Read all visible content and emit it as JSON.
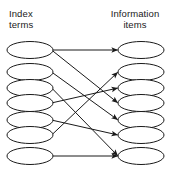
{
  "diagram": {
    "type": "bipartite-graph",
    "title_left": "Index\nterms",
    "title_right": "Information\nitems",
    "left_label_line1": "Index",
    "left_label_line2": "terms",
    "right_label_line1": "Information",
    "right_label_line2": "items",
    "colors": {
      "node_stroke": "#1a1a1a",
      "node_fill": "#ffffff",
      "edge": "#1a1a1a",
      "text": "#1a1a1a",
      "background": "#ffffff"
    },
    "geometry": {
      "left_cx": 30,
      "right_cx": 141,
      "rx": 23,
      "ry": 8.5
    },
    "left_nodes": [
      {
        "id": "L1",
        "cy": 50
      },
      {
        "id": "L2",
        "cy": 72
      },
      {
        "id": "L3",
        "cy": 88
      },
      {
        "id": "L4",
        "cy": 103
      },
      {
        "id": "L5",
        "cy": 120
      },
      {
        "id": "L6",
        "cy": 135
      },
      {
        "id": "L7",
        "cy": 156
      }
    ],
    "right_nodes": [
      {
        "id": "R1",
        "cy": 50
      },
      {
        "id": "R2",
        "cy": 72
      },
      {
        "id": "R3",
        "cy": 88
      },
      {
        "id": "R4",
        "cy": 103
      },
      {
        "id": "R5",
        "cy": 120
      },
      {
        "id": "R6",
        "cy": 135
      },
      {
        "id": "R7",
        "cy": 156
      }
    ],
    "edges": [
      {
        "from": "L1",
        "to": "R1"
      },
      {
        "from": "L1",
        "to": "R4"
      },
      {
        "from": "L2",
        "to": "R5"
      },
      {
        "from": "L3",
        "to": "R7"
      },
      {
        "from": "L4",
        "to": "R3"
      },
      {
        "from": "L5",
        "to": "R6"
      },
      {
        "from": "L6",
        "to": "R2"
      },
      {
        "from": "L7",
        "to": "R7"
      }
    ]
  }
}
